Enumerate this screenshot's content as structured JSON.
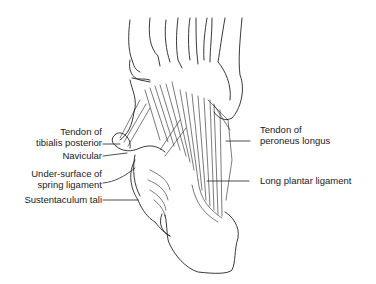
{
  "figure": {
    "labels_left": [
      {
        "id": "tendon-tibialis-posterior",
        "line1": "Tendon of",
        "line2": "tibialis posterior"
      },
      {
        "id": "navicular",
        "line1": "Navicular"
      },
      {
        "id": "spring-ligament",
        "line1": "Under-surface of",
        "line2": "spring ligament"
      },
      {
        "id": "sustentaculum-tali",
        "line1": "Sustentaculum tali"
      }
    ],
    "labels_right": [
      {
        "id": "tendon-peroneus-longus",
        "line1": "Tendon of",
        "line2": "peroneus longus"
      },
      {
        "id": "long-plantar-ligament",
        "line1": "Long plantar ligament"
      }
    ]
  }
}
